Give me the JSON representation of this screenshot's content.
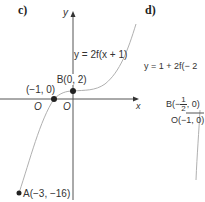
{
  "panel_c": {
    "part_label": "c)",
    "y_axis_label": "y",
    "x_axis_label": "x",
    "equation": "y = 2f(x + 1)",
    "point_b": "B(0, 2)",
    "point_root": "(−1, 0)",
    "point_a": "A(−3, −16)",
    "origin_left": "O",
    "origin_right": "O"
  },
  "panel_d": {
    "part_label": "d)",
    "equation": "y = 1 + 2f(− 2",
    "point_b_prefix": "B(−",
    "point_b_num": "1",
    "point_b_den": "2",
    "point_b_suffix": ", 0)",
    "point_o": "O(−1, 0)"
  },
  "colors": {
    "axis": "#555555",
    "curve": "#b0b0b0",
    "point": "#222222",
    "text": "#333333"
  }
}
